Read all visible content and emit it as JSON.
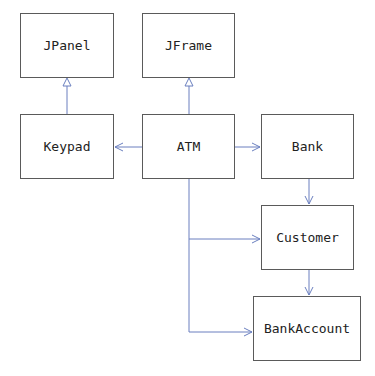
{
  "diagram": {
    "type": "uml-class-diagram",
    "nodes": [
      {
        "id": "jpanel",
        "label": "JPanel"
      },
      {
        "id": "jframe",
        "label": "JFrame"
      },
      {
        "id": "keypad",
        "label": "Keypad"
      },
      {
        "id": "atm",
        "label": "ATM"
      },
      {
        "id": "bank",
        "label": "Bank"
      },
      {
        "id": "customer",
        "label": "Customer"
      },
      {
        "id": "bankaccount",
        "label": "BankAccount"
      }
    ],
    "edges": [
      {
        "from": "Keypad",
        "to": "JPanel",
        "kind": "inheritance"
      },
      {
        "from": "ATM",
        "to": "JFrame",
        "kind": "inheritance"
      },
      {
        "from": "ATM",
        "to": "Keypad",
        "kind": "association"
      },
      {
        "from": "ATM",
        "to": "Bank",
        "kind": "association"
      },
      {
        "from": "Bank",
        "to": "Customer",
        "kind": "association"
      },
      {
        "from": "ATM",
        "to": "Customer",
        "kind": "association"
      },
      {
        "from": "Customer",
        "to": "BankAccount",
        "kind": "association"
      },
      {
        "from": "ATM",
        "to": "BankAccount",
        "kind": "association"
      }
    ],
    "colors": {
      "border": "#5a5a5a",
      "arrow": "#6a7fbf"
    }
  }
}
